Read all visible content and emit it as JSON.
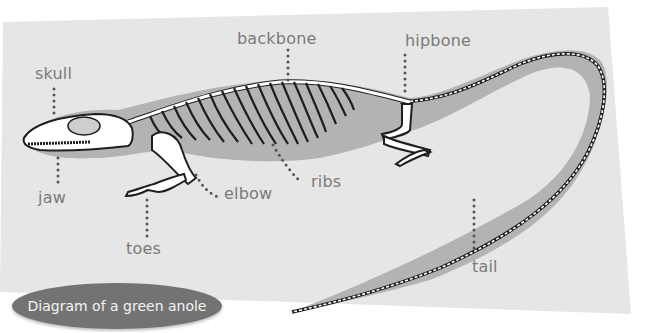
{
  "title": "Diagram of a green anole",
  "colors": {
    "panel": "#e6e6e6",
    "body_shadow": "#b3b3b3",
    "bone": "#ffffff",
    "bone_outline": "#1e1e1e",
    "label_text": "#7a7a7a",
    "leader_dots": "#555555",
    "caption_bg": "#737373",
    "caption_text": "#f4f4f4"
  },
  "labels": {
    "skull": "skull",
    "jaw": "jaw",
    "backbone": "backbone",
    "hipbone": "hipbone",
    "ribs": "ribs",
    "elbow": "elbow",
    "toes": "toes",
    "tail": "tail"
  }
}
